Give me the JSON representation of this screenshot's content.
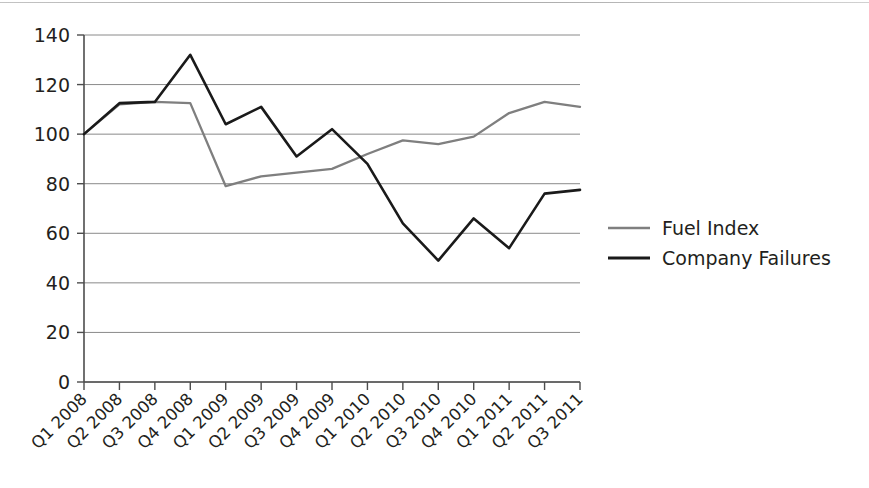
{
  "chart_data": {
    "type": "line",
    "title": "",
    "subtitle": "",
    "xlabel": "",
    "ylabel": "",
    "categories": [
      "Q1 2008",
      "Q2 2008",
      "Q3 2008",
      "Q4 2008",
      "Q1 2009",
      "Q2 2009",
      "Q3 2009",
      "Q4 2009",
      "Q1 2010",
      "Q2 2010",
      "Q3 2010",
      "Q4 2010",
      "Q1 2011",
      "Q2 2011",
      "Q3 2011"
    ],
    "series": [
      {
        "name": "Fuel Index",
        "color": "#7f7f7f",
        "values": [
          100,
          112,
          113,
          112.5,
          79,
          83,
          84.5,
          86,
          92,
          97.5,
          96,
          99,
          108.5,
          113,
          111
        ]
      },
      {
        "name": "Company Failures",
        "color": "#1a1a1a",
        "values": [
          100,
          112.5,
          113,
          132,
          104,
          111,
          91,
          102,
          88,
          64,
          49,
          66,
          54,
          76,
          77.5
        ]
      }
    ],
    "ylim": [
      0,
      140
    ],
    "ytick_values": [
      0,
      20,
      40,
      60,
      80,
      100,
      120,
      140
    ],
    "ytick_labels": [
      "0",
      "20",
      "40",
      "60",
      "80",
      "100",
      "120",
      "140"
    ],
    "grid": true,
    "grid_axis": "y",
    "legend_position": "right",
    "xtick_rotation": 45
  },
  "legend": {
    "entries": [
      {
        "label": "Fuel Index",
        "color": "#7f7f7f"
      },
      {
        "label": "Company Failures",
        "color": "#1a1a1a"
      }
    ]
  },
  "axes": {
    "y_axis_name": "value-axis",
    "x_axis_name": "quarter-axis"
  }
}
